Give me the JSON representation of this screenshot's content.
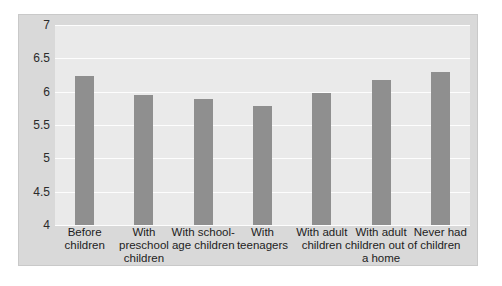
{
  "chart_data": {
    "type": "bar",
    "title": "",
    "subtitle": "",
    "xlabel": "",
    "ylabel": "",
    "categories": [
      "Before children",
      "With preschool children",
      "With school-age children",
      "With teenagers",
      "With adult children",
      "With adult children out of a home",
      "Never had children"
    ],
    "values": [
      6.24,
      5.95,
      5.89,
      5.78,
      5.98,
      6.17,
      6.29
    ],
    "ylim": [
      4,
      7
    ],
    "ytick_labels": [
      "7",
      "6.5",
      "6",
      "5.5",
      "5",
      "4.5",
      "4"
    ],
    "ytick_values": [
      7,
      6.5,
      6,
      5.5,
      5,
      4.5,
      4
    ],
    "grid": true,
    "legend": false,
    "legend_position": "none",
    "colors": {
      "bar": "#8f8f8f",
      "plot_background": "#eaeaea",
      "frame_background": "#d9d9d9",
      "gridline": "#fdfdfd",
      "text": "#1d1d1d"
    }
  }
}
